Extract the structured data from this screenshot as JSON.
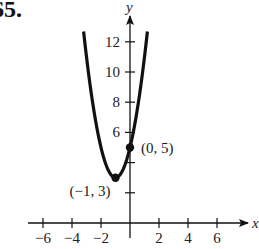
{
  "problem": {
    "number": "65."
  },
  "chart_data": {
    "type": "line",
    "title": "",
    "function": "y = 2(x + 1)^2 + 3",
    "xlabel": "x",
    "ylabel": "y",
    "xlim": [
      -7,
      8
    ],
    "ylim": [
      0,
      13.5
    ],
    "x_ticks": [
      -6,
      -4,
      -2,
      2,
      4,
      6
    ],
    "x_tick_labels": [
      "−6",
      "−4",
      "−2",
      "2",
      "4",
      "6"
    ],
    "y_ticks": [
      2,
      4,
      6,
      8,
      10,
      12
    ],
    "y_tick_labels": [
      "",
      "",
      "6",
      "8",
      "10",
      "12"
    ],
    "grid": false,
    "series": [
      {
        "name": "parabola",
        "x": [
          -3.2,
          -3,
          -2.5,
          -2,
          -1.5,
          -1,
          -0.5,
          0,
          0.5,
          1,
          1.2
        ],
        "values": [
          12.68,
          11,
          7.5,
          5,
          3.5,
          3,
          3.5,
          5,
          7.5,
          11,
          12.68
        ]
      }
    ],
    "annotations": [
      {
        "label": "(−1, 3)",
        "x": -1,
        "y": 3,
        "marker": "dot"
      },
      {
        "label": "(0, 5)",
        "x": 0,
        "y": 5,
        "marker": "dot"
      }
    ]
  }
}
